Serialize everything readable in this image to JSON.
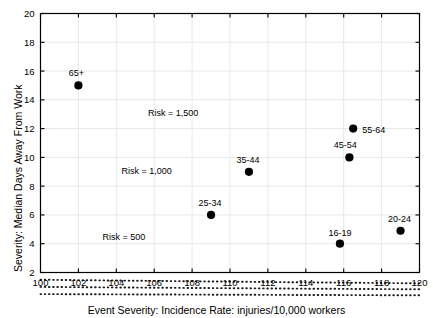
{
  "chart_data": {
    "type": "scatter",
    "title": "",
    "xlabel": "Event Severity: Incidence Rate: injuries/10,000 workers",
    "ylabel": "Severity: Median Days Away From Work",
    "xlim": [
      100,
      120
    ],
    "ylim": [
      2,
      20
    ],
    "xticks": [
      100,
      102,
      104,
      106,
      108,
      110,
      112,
      114,
      116,
      118,
      120
    ],
    "yticks": [
      2,
      4,
      6,
      8,
      10,
      12,
      14,
      16,
      18,
      20
    ],
    "grid": true,
    "legend_position": "none",
    "points": [
      {
        "label": "65+",
        "x": 102.0,
        "y": 15.0,
        "label_dx": -2,
        "label_dy": -9,
        "anchor": "middle"
      },
      {
        "label": "55-64",
        "x": 116.5,
        "y": 12.0,
        "label_dx": 9,
        "label_dy": 4,
        "anchor": "start"
      },
      {
        "label": "45-54",
        "x": 116.3,
        "y": 10.0,
        "label_dx": -4,
        "label_dy": -9,
        "anchor": "middle"
      },
      {
        "label": "35-44",
        "x": 111.0,
        "y": 9.0,
        "label_dx": -1,
        "label_dy": -9,
        "anchor": "middle"
      },
      {
        "label": "25-34",
        "x": 109.0,
        "y": 6.0,
        "label_dx": -1,
        "label_dy": -9,
        "anchor": "middle"
      },
      {
        "label": "16-19",
        "x": 115.8,
        "y": 4.0,
        "label_dx": 0,
        "label_dy": -8,
        "anchor": "middle"
      },
      {
        "label": "20-24",
        "x": 119.0,
        "y": 4.9,
        "label_dx": -1,
        "label_dy": -9,
        "anchor": "middle"
      }
    ],
    "risk_curves": [
      {
        "name": "Risk = 1,500",
        "risk": 1500,
        "label_x": 107.0,
        "label_y": 12.85
      },
      {
        "name": "Risk = 1,000",
        "risk": 1000,
        "label_x": 105.6,
        "label_y": 8.85
      },
      {
        "name": "Risk = 500",
        "risk": 500,
        "label_x": 104.4,
        "label_y": 4.25
      }
    ],
    "colors": {
      "point": "#000000",
      "curve": "#1a1a1a",
      "axis": "#000000",
      "grid": "#e8e8e8",
      "background": "#ffffff"
    }
  }
}
